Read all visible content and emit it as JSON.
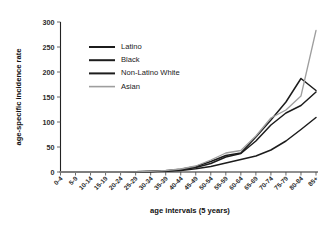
{
  "chart_data": {
    "type": "line",
    "title": "",
    "xlabel": "age intervals (5 years)",
    "ylabel": "age-specific incidence rate",
    "categories": [
      "0-4",
      "5-9",
      "10-14",
      "15-19",
      "20-24",
      "25-29",
      "30-34",
      "35-39",
      "40-44",
      "45-49",
      "50-54",
      "55-59",
      "60-64",
      "65-69",
      "70-74",
      "75-79",
      "80-84",
      "85+"
    ],
    "ylim": [
      0,
      300
    ],
    "yticks": [
      0,
      50,
      100,
      150,
      200,
      250,
      300
    ],
    "grid": false,
    "legend_position": "upper-left-inside",
    "series": [
      {
        "name": "Latino",
        "color": "#1c1c1c",
        "values": [
          0,
          0,
          0,
          0,
          0,
          0.3,
          0.8,
          1.6,
          3.2,
          6.5,
          11,
          18,
          25,
          32,
          44,
          62,
          85,
          109
        ]
      },
      {
        "name": "Black",
        "color": "#1c1c1c",
        "values": [
          0,
          0,
          0,
          0,
          0,
          0.4,
          1.2,
          2.6,
          5.5,
          11,
          21,
          33,
          38,
          70,
          104,
          140,
          187,
          163
        ]
      },
      {
        "name": "Non-Latino White",
        "color": "#1c1c1c",
        "values": [
          0,
          0,
          0,
          0,
          0,
          0.3,
          1.0,
          2.2,
          4.6,
          9,
          17,
          30,
          37,
          62,
          94,
          118,
          133,
          160
        ]
      },
      {
        "name": "Asian",
        "color": "#9e9e9e",
        "values": [
          0,
          0,
          0,
          0,
          0,
          0.4,
          1.4,
          3.0,
          6.0,
          12,
          24,
          38,
          43,
          72,
          108,
          124,
          152,
          283
        ]
      }
    ]
  },
  "axes": {
    "y_tick_labels": [
      "0",
      "50",
      "100",
      "150",
      "200",
      "250",
      "300"
    ],
    "y_axis_title": "age-specific incidence rate",
    "x_axis_title": "age intervals (5 years)"
  },
  "legend": {
    "items": [
      {
        "label": "Latino",
        "color": "#1c1c1c"
      },
      {
        "label": "Black",
        "color": "#1c1c1c"
      },
      {
        "label": "Non-Latino White",
        "color": "#1c1c1c"
      },
      {
        "label": "Asian",
        "color": "#9e9e9e"
      }
    ]
  }
}
